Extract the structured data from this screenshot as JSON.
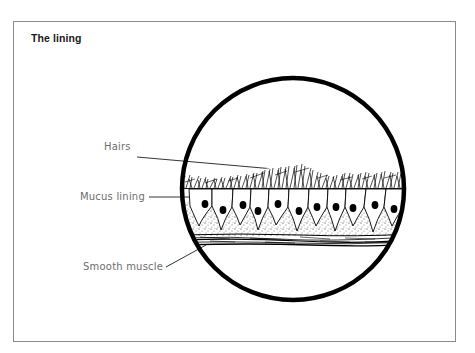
{
  "diagram": {
    "title": "The lining",
    "labels": {
      "hairs": "Hairs",
      "mucus_lining": "Mucus lining",
      "smooth_muscle": "Smooth muscle"
    },
    "colors": {
      "ink": "#000000",
      "label_text": "#6d6d6d",
      "frame": "#8a8a8a",
      "background": "#ffffff"
    }
  }
}
